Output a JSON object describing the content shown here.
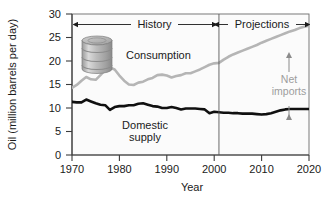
{
  "figure": {
    "background": "#ffffff",
    "plot_background": "#fbfbfb"
  },
  "axes": {
    "y_title": "Oil (million barrels per day)",
    "x_title": "Year",
    "y_ticks": [
      "0",
      "5",
      "10",
      "15",
      "20",
      "25",
      "30"
    ],
    "x_ticks": [
      "1970",
      "1980",
      "1990",
      "2000",
      "2010",
      "2020"
    ]
  },
  "annotations": {
    "history_label": "History",
    "projections_label": "Projections",
    "net_imports_label_line1": "Net",
    "net_imports_label_line2": "imports",
    "consumption_label": "Consumption",
    "domestic_label_line1": "Domestic",
    "domestic_label_line2": "supply",
    "divider_year": 2001,
    "barrel_icon": "oil-barrel-icon"
  },
  "colors": {
    "consumption": "#b5b5b5",
    "domestic": "#101010",
    "axis": "#4a4a4a",
    "net_imports_text": "#9d9d9d",
    "barrel_body": "#b9b9b9",
    "barrel_shade": "#8f8f8f",
    "barrel_light": "#d8d8d8"
  },
  "chart_data": {
    "type": "line",
    "title": "",
    "xlabel": "Year",
    "ylabel": "Oil (million barrels per day)",
    "xlim": [
      1970,
      2020
    ],
    "ylim": [
      0,
      30
    ],
    "grid": false,
    "legend": "inline-annotations",
    "divider_x": 2001,
    "regions": [
      {
        "label": "History",
        "x_start": 1970,
        "x_end": 2001
      },
      {
        "label": "Projections",
        "x_start": 2001,
        "x_end": 2020
      }
    ],
    "series": [
      {
        "name": "Consumption",
        "color": "#b5b5b5",
        "x": [
          1970,
          1971,
          1972,
          1973,
          1974,
          1975,
          1976,
          1977,
          1978,
          1979,
          1980,
          1981,
          1982,
          1983,
          1984,
          1985,
          1986,
          1987,
          1988,
          1989,
          1990,
          1991,
          1992,
          1993,
          1994,
          1995,
          1996,
          1997,
          1998,
          1999,
          2000,
          2001,
          2002,
          2003,
          2004,
          2005,
          2006,
          2007,
          2008,
          2009,
          2010,
          2011,
          2012,
          2013,
          2014,
          2015,
          2016,
          2017,
          2018,
          2019,
          2020
        ],
        "values": [
          14.3,
          14.9,
          15.8,
          16.6,
          16.1,
          16.0,
          17.0,
          18.1,
          18.6,
          18.2,
          16.9,
          15.8,
          15.0,
          14.9,
          15.4,
          15.6,
          16.1,
          16.4,
          17.0,
          17.1,
          16.9,
          16.5,
          16.8,
          17.0,
          17.4,
          17.4,
          17.8,
          18.2,
          18.7,
          19.2,
          19.5,
          19.6,
          20.3,
          20.9,
          21.4,
          21.8,
          22.2,
          22.6,
          23.0,
          23.4,
          23.9,
          24.3,
          24.7,
          25.1,
          25.5,
          25.9,
          26.3,
          26.6,
          27.0,
          27.3,
          27.5
        ]
      },
      {
        "name": "Domestic supply",
        "color": "#101010",
        "x": [
          1970,
          1971,
          1972,
          1973,
          1974,
          1975,
          1976,
          1977,
          1978,
          1979,
          1980,
          1981,
          1982,
          1983,
          1984,
          1985,
          1986,
          1987,
          1988,
          1989,
          1990,
          1991,
          1992,
          1993,
          1994,
          1995,
          1996,
          1997,
          1998,
          1999,
          2000,
          2001,
          2002,
          2003,
          2004,
          2005,
          2006,
          2007,
          2008,
          2009,
          2010,
          2011,
          2012,
          2013,
          2014,
          2015,
          2016,
          2017,
          2018,
          2019,
          2020
        ],
        "values": [
          11.3,
          11.2,
          11.2,
          11.8,
          11.4,
          11.0,
          10.7,
          10.6,
          9.6,
          10.2,
          10.4,
          10.4,
          10.6,
          10.6,
          10.9,
          11.0,
          10.7,
          10.4,
          10.3,
          10.0,
          10.0,
          10.2,
          10.0,
          9.7,
          9.9,
          9.9,
          9.9,
          9.8,
          9.7,
          8.9,
          9.2,
          9.1,
          9.0,
          9.0,
          8.9,
          8.9,
          8.8,
          8.8,
          8.8,
          8.7,
          8.6,
          8.7,
          8.9,
          9.2,
          9.5,
          9.7,
          9.8,
          9.8,
          9.8,
          9.8,
          9.8
        ]
      }
    ],
    "net_imports_marker": {
      "x": 2016,
      "y_top": 26.3,
      "y_bottom": 9.8,
      "label": "Net imports"
    }
  }
}
